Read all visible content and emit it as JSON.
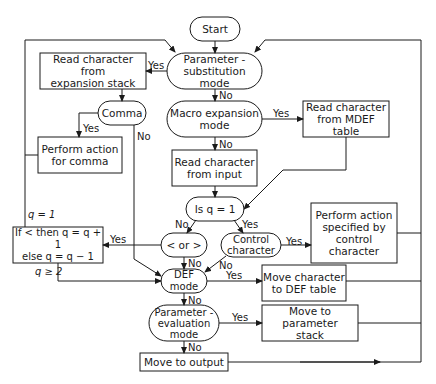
{
  "diagram": {
    "type": "flowchart",
    "nodes": {
      "start": {
        "label": "Start",
        "shape": "terminal"
      },
      "param_sub": {
        "label": "Parameter -\nsubstitution mode",
        "shape": "decision"
      },
      "read_exp_stack": {
        "label": "Read character from\nexpansion stack",
        "shape": "process"
      },
      "comma": {
        "label": "Comma",
        "shape": "decision"
      },
      "perform_comma": {
        "label": "Perform action\nfor comma",
        "shape": "process"
      },
      "macro_exp": {
        "label": "Macro expansion\nmode",
        "shape": "decision"
      },
      "read_mdef": {
        "label": "Read character\nfrom MDEF table",
        "shape": "process"
      },
      "read_input": {
        "label": "Read character\nfrom input",
        "shape": "process"
      },
      "is_q1": {
        "label": "Is q = 1",
        "shape": "decision"
      },
      "lt_gt": {
        "label": "< or >",
        "shape": "decision"
      },
      "control_char": {
        "label": "Control\ncharacter",
        "shape": "decision"
      },
      "perform_control": {
        "label": "Perform action\nspecified by\ncontrol\ncharacter",
        "shape": "process"
      },
      "if_lt": {
        "label": "If < then q = q + 1\nelse q = q − 1",
        "shape": "process"
      },
      "def_mode": {
        "label": "DEF mode",
        "shape": "decision"
      },
      "move_def": {
        "label": "Move character\nto DEF table",
        "shape": "process"
      },
      "param_eval": {
        "label": "Parameter -\nevaluation\nmode",
        "shape": "decision"
      },
      "move_param_stack": {
        "label": "Move to parameter\nstack",
        "shape": "process"
      },
      "move_output": {
        "label": "Move to output",
        "shape": "process"
      }
    },
    "edge_labels": {
      "param_sub_yes": "Yes",
      "param_sub_no": "No",
      "comma_yes": "Yes",
      "comma_no": "No",
      "macro_yes": "Yes",
      "macro_no": "No",
      "is_q1_no": "No",
      "is_q1_yes": "Yes",
      "lt_gt_yes": "Yes",
      "lt_gt_no": "No",
      "control_yes": "Yes",
      "control_no": "No",
      "def_yes": "Yes",
      "def_no": "No",
      "param_eval_yes": "Yes",
      "param_eval_no": "No",
      "q_eq_1": "q = 1",
      "q_ge_2": "q ≥ 2"
    },
    "colors": {
      "line": "#1a1a1a",
      "background": "#ffffff"
    }
  }
}
